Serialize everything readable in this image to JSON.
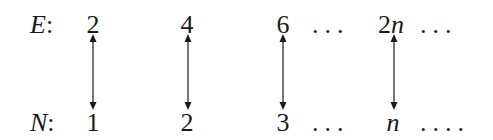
{
  "rows": {
    "top": {
      "label": "E",
      "colon": ":",
      "items": [
        "2",
        "4",
        "6",
        "2",
        "n"
      ],
      "dots1": "...",
      "dots2": "..."
    },
    "bottom": {
      "label": "N",
      "colon": ":",
      "items": [
        "1",
        "2",
        "3",
        "n"
      ],
      "dots1": "...",
      "dots2": "...."
    }
  },
  "arrows": [
    {
      "from": "2",
      "to": "1"
    },
    {
      "from": "4",
      "to": "2"
    },
    {
      "from": "6",
      "to": "3"
    },
    {
      "from": "2n",
      "to": "n"
    }
  ],
  "colors": {
    "ink": "#1a1a1a",
    "background": "#ffffff"
  }
}
